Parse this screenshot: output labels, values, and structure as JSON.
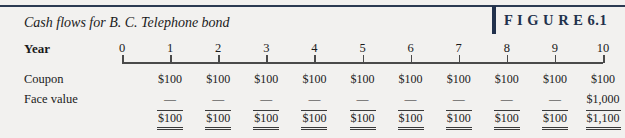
{
  "figure": {
    "label": "F I G U R E  6.1",
    "caption": "Cash flows for B. C. Telephone bond",
    "rule_color": "#2b3a52",
    "accent_color": "#22314c"
  },
  "rows": {
    "year_label": "Year",
    "coupon_label": "Coupon",
    "face_value_label": "Face value"
  },
  "chart_data": {
    "type": "table",
    "title": "Cash flows for B. C. Telephone bond",
    "xlabel": "Year",
    "categories": [
      "0",
      "1",
      "2",
      "3",
      "4",
      "5",
      "6",
      "7",
      "8",
      "9",
      "10"
    ],
    "series": [
      {
        "name": "Coupon",
        "values": [
          "",
          "$100",
          "$100",
          "$100",
          "$100",
          "$100",
          "$100",
          "$100",
          "$100",
          "$100",
          "$100"
        ]
      },
      {
        "name": "Face value",
        "values": [
          "",
          "—",
          "—",
          "—",
          "—",
          "—",
          "—",
          "—",
          "—",
          "—",
          "$1,000"
        ]
      },
      {
        "name": "Total",
        "values": [
          "",
          "$100",
          "$100",
          "$100",
          "$100",
          "$100",
          "$100",
          "$100",
          "$100",
          "$100",
          "$1,100"
        ]
      }
    ],
    "axis": {
      "ticks": [
        0,
        1,
        2,
        3,
        4,
        5,
        6,
        7,
        8,
        9,
        10
      ],
      "grid": false,
      "legend": "none"
    }
  }
}
